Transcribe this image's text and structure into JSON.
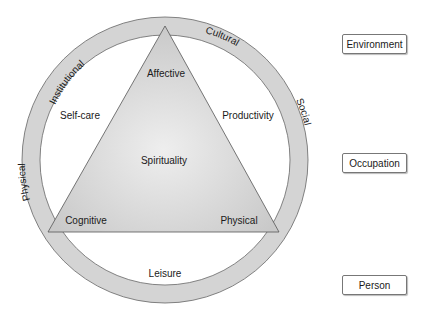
{
  "diagram": {
    "ring_labels": {
      "top_left": "Institutional",
      "top_right": "Cultural",
      "left": "Physical",
      "right": "Social"
    },
    "occupation_labels": {
      "upper_left": "Self-care",
      "upper_right": "Productivity",
      "bottom": "Leisure"
    },
    "triangle_labels": {
      "apex": "Affective",
      "center": "Spirituality",
      "bottom_left": "Cognitive",
      "bottom_right": "Physical"
    },
    "legend": [
      {
        "label": "Environment"
      },
      {
        "label": "Occupation"
      },
      {
        "label": "Person"
      }
    ]
  }
}
